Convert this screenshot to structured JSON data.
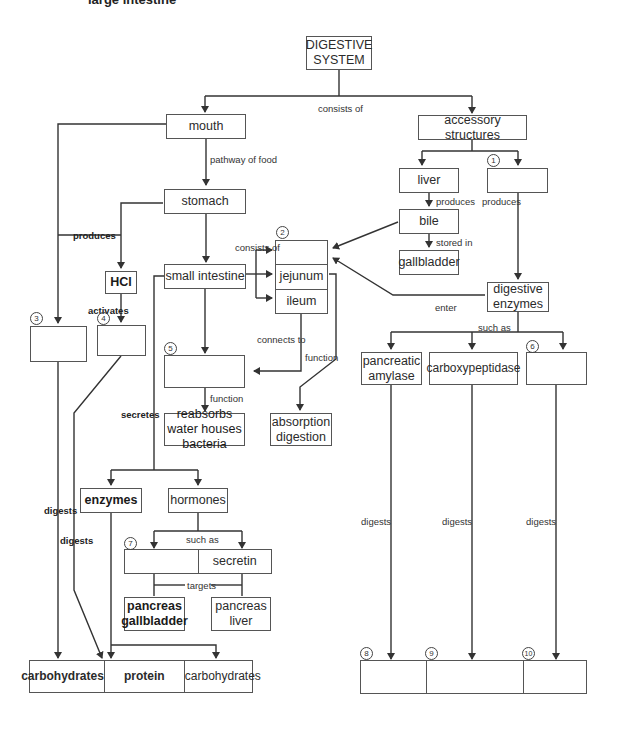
{
  "header": {
    "cut_off_text": "large intestine"
  },
  "nodes": {
    "root": "DIGESTIVE\nSYSTEM",
    "mouth": "mouth",
    "accessory": "accessory structures",
    "liver": "liver",
    "blank1": "",
    "bile": "bile",
    "gallbladder": "gallbladder",
    "stomach": "stomach",
    "hcl": "HCl",
    "small_intestine": "small intestine",
    "si_parts": [
      "",
      "jejunum",
      "ileum"
    ],
    "digestive_enzymes": "digestive enzymes",
    "blank3": "",
    "blank4": "",
    "blank5": "",
    "reabsorbs": "reabsorbs water houses bacteria",
    "absorption": "absorption digestion",
    "pancreatic_amylase": "pancreatic amylase",
    "carboxypeptidase": "carboxypeptidase",
    "blank6": "",
    "enzymes": "enzymes",
    "hormones": "hormones",
    "hormone_pair": [
      "",
      "secretin"
    ],
    "pancreas_gallbladder": "pancreas gallbladder",
    "pancreas_liver": "pancreas liver",
    "bottom_left": [
      "carbohydrates",
      "protein",
      "carbohydrates"
    ],
    "bottom_right": [
      "",
      "",
      ""
    ]
  },
  "labels": {
    "consists_of": "consists of",
    "pathway_of_food": "pathway of food",
    "produces_left": "produces",
    "produces_liver": "produces",
    "produces_blank1": "produces",
    "stored_in": "stored in",
    "consists_of_si": "consists of",
    "activates": "activates",
    "enter": "enter",
    "such_as_enzymes": "such as",
    "connects_to": "connects to",
    "function_ileum": "function",
    "function_5": "function",
    "secretes": "secretes",
    "digests_3": "digests",
    "digests_4": "digests",
    "such_as_hormones": "such as",
    "targets": "targets",
    "digests_amylase": "digests",
    "digests_carboxy": "digests",
    "digests_6": "digests"
  },
  "numbers": [
    "1",
    "2",
    "3",
    "4",
    "5",
    "6",
    "7",
    "8",
    "9",
    "10"
  ],
  "colors": {
    "line": "#333333",
    "box_border": "#555555",
    "background": "#ffffff"
  }
}
